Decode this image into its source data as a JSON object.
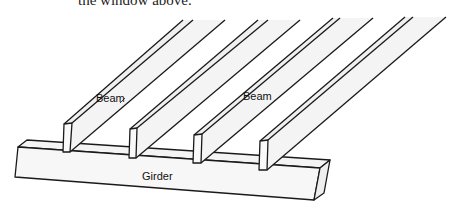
{
  "caption_fragment": "the window above.",
  "labels": {
    "beam_left": "Beam",
    "beam_right": "Beam",
    "girder": "Girder"
  },
  "colors": {
    "line": "#1a1a1a",
    "fill_light": "#f2f2f2",
    "fill_face": "#f7f7f7",
    "background": "#ffffff"
  }
}
